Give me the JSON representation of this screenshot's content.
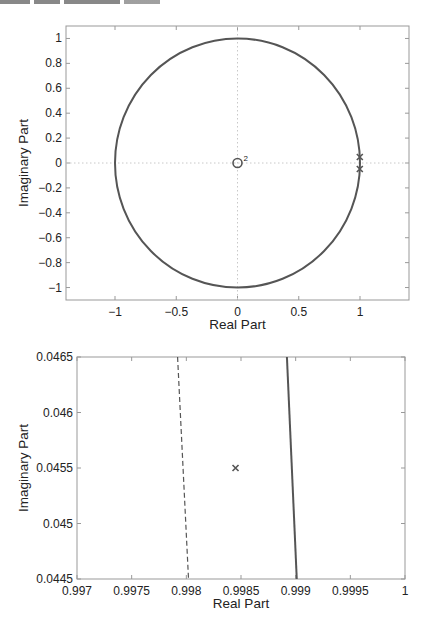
{
  "chart_data": [
    {
      "type": "scatter",
      "title": "",
      "xlabel": "Real Part",
      "ylabel": "Imaginary Part",
      "xlim": [
        -1.4,
        1.4
      ],
      "ylim": [
        -1.1,
        1.1
      ],
      "grid": false,
      "xticks": [
        -1,
        -0.5,
        0,
        0.5,
        1
      ],
      "xtick_labels": [
        "−1",
        "−0.5",
        "0",
        "0.5",
        "1"
      ],
      "yticks": [
        1,
        0.8,
        0.6,
        0.4,
        0.2,
        0,
        -0.2,
        -0.4,
        -0.6,
        -0.8,
        -1
      ],
      "ytick_labels": [
        "1",
        "0.8",
        "0.6",
        "0.4",
        "0.2",
        "0",
        "−0.2",
        "−0.4",
        "−0.6",
        "−0.8",
        "−1"
      ],
      "series": [
        {
          "name": "unit circle",
          "kind": "line",
          "center": [
            0,
            0
          ],
          "radius": 1
        },
        {
          "name": "zeros",
          "kind": "marker",
          "marker": "o",
          "points": [
            [
              0,
              0
            ]
          ],
          "multiplicity_label": "2"
        },
        {
          "name": "poles",
          "kind": "marker",
          "marker": "x",
          "points": [
            [
              0.99845,
              0.0455
            ],
            [
              0.99845,
              -0.0455
            ]
          ]
        }
      ],
      "reference_lines": {
        "x": 0,
        "y": 0,
        "style": "dotted"
      }
    },
    {
      "type": "scatter",
      "title": "",
      "xlabel": "Real Part",
      "ylabel": "Imaginary Part",
      "xlim": [
        0.997,
        1.0
      ],
      "ylim": [
        0.0445,
        0.0465
      ],
      "grid": false,
      "xticks": [
        0.997,
        0.9975,
        0.998,
        0.9985,
        0.999,
        0.9995,
        1
      ],
      "xtick_labels": [
        "0.997",
        "0.9975",
        "0.998",
        "0.9985",
        "0.999",
        "0.9995",
        "1"
      ],
      "yticks": [
        0.0465,
        0.046,
        0.0455,
        0.045,
        0.0445
      ],
      "ytick_labels": [
        "0.0465",
        "0.046",
        "0.0455",
        "0.045",
        "0.0445"
      ],
      "series": [
        {
          "name": "dashed boundary",
          "kind": "line",
          "style": "dashed",
          "points": [
            [
              0.99792,
              0.0465
            ],
            [
              0.99802,
              0.0445
            ]
          ]
        },
        {
          "name": "unit circle",
          "kind": "line",
          "style": "solid",
          "points": [
            [
              0.99892,
              0.0465
            ],
            [
              0.99901,
              0.0445
            ]
          ]
        },
        {
          "name": "pole",
          "kind": "marker",
          "marker": "x",
          "points": [
            [
              0.99845,
              0.0455
            ]
          ]
        }
      ]
    }
  ],
  "colors": {
    "curve": "#555555",
    "frame": "#999999",
    "reference": "#c8c8c8",
    "text": "#222222"
  }
}
